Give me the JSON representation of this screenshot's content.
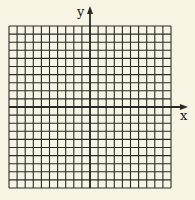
{
  "diagram": {
    "type": "coordinate-grid",
    "grid": {
      "cols": 20,
      "rows": 20,
      "left": 9,
      "top": 26,
      "cell": 8.1
    },
    "axes": {
      "x_label": "x",
      "y_label": "y",
      "x_axis_row": 10,
      "y_axis_col": 10
    },
    "colors": {
      "background": "#f8f4e3",
      "lines": "#2a2a2a"
    }
  }
}
